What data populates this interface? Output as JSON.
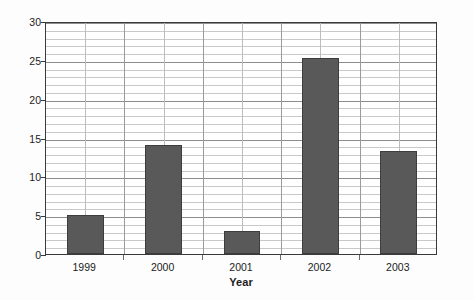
{
  "chart_data": {
    "type": "bar",
    "title": "",
    "xlabel": "Year",
    "ylabel": "Percentage change",
    "categories": [
      "1999",
      "2000",
      "2001",
      "2002",
      "2003"
    ],
    "values": [
      5,
      14,
      3,
      25.2,
      13.2
    ],
    "ylim": [
      0,
      30
    ],
    "y_ticks": [
      0,
      5,
      10,
      15,
      20,
      25,
      30
    ],
    "y_tick_labels": [
      "0",
      "5",
      "10",
      "15",
      "20",
      "25",
      "30"
    ],
    "y_minor_tick_step": 1,
    "grid": "horizontal-major-minor-and-vertical",
    "legend": "none",
    "bar_color": "#595959",
    "bar_edge_color": "#3d3d3d",
    "plot_border_color": "#3a3a3a",
    "major_gridline_color": "#8d8d8d",
    "minor_gridline_color": "#c9c9c9",
    "vertical_gridline_color": "#9a9a9a",
    "background_color": "#ffffff",
    "series": [
      {
        "name": "Percentage change",
        "points": [
          {
            "category": "1999",
            "value": 5
          },
          {
            "category": "2000",
            "value": 14
          },
          {
            "category": "2001",
            "value": 3
          },
          {
            "category": "2002",
            "value": 25.2
          },
          {
            "category": "2003",
            "value": 13.2
          }
        ]
      }
    ]
  }
}
